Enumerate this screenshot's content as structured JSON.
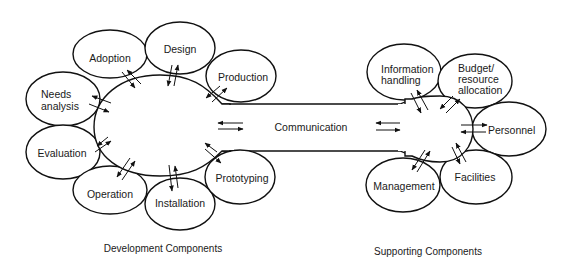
{
  "diagram": {
    "type": "component-relationship",
    "development": {
      "caption": "Development Components",
      "hub": "development-hub",
      "components": [
        {
          "id": "adoption",
          "label": [
            "Adoption"
          ]
        },
        {
          "id": "design",
          "label": [
            "Design"
          ]
        },
        {
          "id": "production",
          "label": [
            "Production"
          ]
        },
        {
          "id": "needs-analysis",
          "label": [
            "Needs",
            "analysis"
          ]
        },
        {
          "id": "evaluation",
          "label": [
            "Evaluation"
          ]
        },
        {
          "id": "operation",
          "label": [
            "Operation"
          ]
        },
        {
          "id": "installation",
          "label": [
            "Installation"
          ]
        },
        {
          "id": "prototyping",
          "label": [
            "Prototyping"
          ]
        }
      ]
    },
    "channel": {
      "label": "Communication"
    },
    "supporting": {
      "caption": "Supporting Components",
      "hub": "supporting-hub",
      "components": [
        {
          "id": "information-handling",
          "label": [
            "Information",
            "handling"
          ]
        },
        {
          "id": "budget",
          "label": [
            "Budget/",
            "resource",
            "allocation"
          ]
        },
        {
          "id": "personnel",
          "label": [
            "Personnel"
          ]
        },
        {
          "id": "facilities",
          "label": [
            "Facilities"
          ]
        },
        {
          "id": "management",
          "label": [
            "Management"
          ]
        }
      ]
    },
    "edges": [
      {
        "from": "development-hub",
        "to": "adoption",
        "direction": "bidirectional"
      },
      {
        "from": "development-hub",
        "to": "design",
        "direction": "bidirectional"
      },
      {
        "from": "development-hub",
        "to": "production",
        "direction": "bidirectional"
      },
      {
        "from": "development-hub",
        "to": "needs-analysis",
        "direction": "bidirectional"
      },
      {
        "from": "development-hub",
        "to": "evaluation",
        "direction": "bidirectional"
      },
      {
        "from": "development-hub",
        "to": "operation",
        "direction": "bidirectional"
      },
      {
        "from": "development-hub",
        "to": "installation",
        "direction": "bidirectional"
      },
      {
        "from": "development-hub",
        "to": "prototyping",
        "direction": "bidirectional"
      },
      {
        "from": "development-hub",
        "to": "supporting-hub",
        "via": "Communication",
        "direction": "bidirectional"
      },
      {
        "from": "supporting-hub",
        "to": "information-handling",
        "direction": "bidirectional"
      },
      {
        "from": "supporting-hub",
        "to": "budget",
        "direction": "bidirectional"
      },
      {
        "from": "supporting-hub",
        "to": "personnel",
        "direction": "bidirectional"
      },
      {
        "from": "supporting-hub",
        "to": "facilities",
        "direction": "bidirectional"
      },
      {
        "from": "supporting-hub",
        "to": "management",
        "direction": "bidirectional"
      }
    ]
  },
  "labels": {
    "adoption": "Adoption",
    "design": "Design",
    "production": "Production",
    "needs_1": "Needs",
    "needs_2": "analysis",
    "evaluation": "Evaluation",
    "operation": "Operation",
    "installation": "Installation",
    "prototyping": "Prototyping",
    "communication": "Communication",
    "info_1": "Information",
    "info_2": "handling",
    "budget_1": "Budget/",
    "budget_2": "resource",
    "budget_3": "allocation",
    "personnel": "Personnel",
    "facilities": "Facilities",
    "management": "Management",
    "dev_caption": "Development Components",
    "sup_caption": "Supporting Components"
  }
}
